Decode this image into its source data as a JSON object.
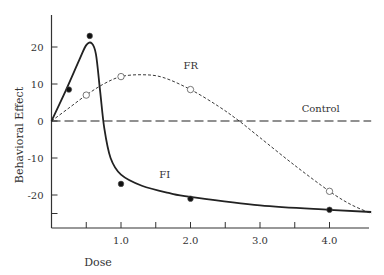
{
  "chart_data": {
    "type": "line",
    "title": "",
    "xlabel": "Dose",
    "ylabel": "Behavioral Effect",
    "xlim": [
      0,
      4.6
    ],
    "ylim": [
      -29,
      29
    ],
    "x_ticks": [
      0.5,
      1.0,
      1.5,
      2.0,
      2.5,
      3.0,
      3.5,
      4.0
    ],
    "x_tick_labels": [
      "1.0",
      "2.0",
      "3.0",
      "4.0"
    ],
    "x_tick_label_values": [
      1.0,
      2.0,
      3.0,
      4.0
    ],
    "y_ticks": [
      -25,
      -20,
      -10,
      0,
      10,
      20
    ],
    "y_tick_labels": [
      "20",
      "10",
      "0",
      "-10",
      "-20"
    ],
    "y_tick_label_values": [
      20,
      10,
      0,
      -10,
      -20
    ],
    "grid": false,
    "legend": "none (inline labels)",
    "series": [
      {
        "name": "FI",
        "style": "solid",
        "marker": "filled-circle",
        "points": [
          [
            0.25,
            8.5
          ],
          [
            0.55,
            23
          ],
          [
            1.0,
            -17
          ],
          [
            2.0,
            -21
          ],
          [
            4.0,
            -24
          ]
        ],
        "curve": [
          [
            0,
            0
          ],
          [
            0.2,
            8
          ],
          [
            0.4,
            16.5
          ],
          [
            0.5,
            20.5
          ],
          [
            0.58,
            21
          ],
          [
            0.64,
            18
          ],
          [
            0.7,
            8
          ],
          [
            0.76,
            -2
          ],
          [
            0.85,
            -10
          ],
          [
            1.0,
            -14.5
          ],
          [
            1.3,
            -17.5
          ],
          [
            1.7,
            -19.5
          ],
          [
            2.0,
            -20.5
          ],
          [
            3.0,
            -22.8
          ],
          [
            4.0,
            -24
          ],
          [
            4.6,
            -24.6
          ]
        ]
      },
      {
        "name": "FR",
        "style": "short-dashed",
        "marker": "open-circle",
        "points": [
          [
            0.5,
            7
          ],
          [
            1.0,
            12
          ],
          [
            2.0,
            8.5
          ],
          [
            4.0,
            -19
          ]
        ],
        "curve": [
          [
            0,
            0
          ],
          [
            0.25,
            3.5
          ],
          [
            0.5,
            7
          ],
          [
            0.75,
            10
          ],
          [
            1.0,
            12
          ],
          [
            1.3,
            12.5
          ],
          [
            1.6,
            11.8
          ],
          [
            2.0,
            8.5
          ],
          [
            2.4,
            4
          ],
          [
            2.7,
            0
          ],
          [
            3.0,
            -4.5
          ],
          [
            3.5,
            -12
          ],
          [
            4.0,
            -19
          ],
          [
            4.3,
            -22.5
          ],
          [
            4.6,
            -25
          ]
        ]
      },
      {
        "name": "Control",
        "style": "long-dashed",
        "marker": "none",
        "curve": [
          [
            0,
            0
          ],
          [
            4.6,
            0
          ]
        ]
      }
    ],
    "annotations": [
      {
        "text": "FR",
        "x": 1.9,
        "y": 14
      },
      {
        "text": "Control",
        "x": 3.6,
        "y": 2.4
      },
      {
        "text": "FI",
        "x": 1.55,
        "y": -15.5
      }
    ]
  },
  "labels": {
    "xlabel": "Dose",
    "ylabel": "Behavioral Effect",
    "fr": "FR",
    "fi": "FI",
    "control": "Control"
  }
}
